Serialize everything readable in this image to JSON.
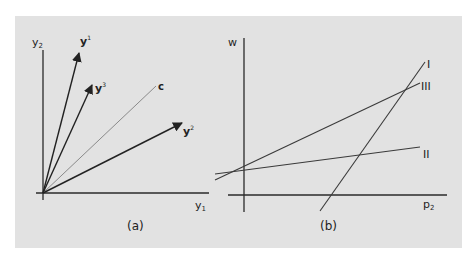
{
  "figure": {
    "background": "#e2e2e2",
    "panel_a": {
      "caption": "(a)",
      "x_axis_label": "y",
      "x_axis_sub": "1",
      "y_axis_label": "y",
      "y_axis_sub": "2",
      "vectors": [
        {
          "name": "y",
          "sup": "1",
          "bold": true
        },
        {
          "name": "y",
          "sup": "3",
          "bold": true
        },
        {
          "name": "c",
          "sup": "",
          "bold": true
        },
        {
          "name": "y",
          "sup": "2",
          "bold": true
        }
      ]
    },
    "panel_b": {
      "caption": "(b)",
      "x_axis_label": "p",
      "x_axis_sub": "2",
      "y_axis_label": "w",
      "lines": [
        {
          "label": "I"
        },
        {
          "label": "III"
        },
        {
          "label": "II"
        }
      ]
    },
    "colors": {
      "axis": "#2a2a2a",
      "vector": "#222222",
      "c_line": "#8a8a8a",
      "line": "#3a3a3a"
    }
  }
}
